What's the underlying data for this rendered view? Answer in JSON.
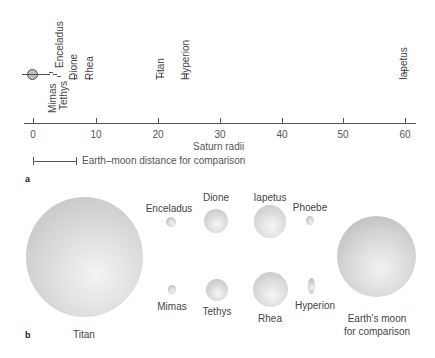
{
  "panel_a": {
    "label": "a",
    "axis_label": "Saturn radii",
    "ticks": [
      "0",
      "10",
      "20",
      "30",
      "40",
      "50",
      "60"
    ],
    "comparison_label": "Earth–moon distance for comparison",
    "moons": [
      {
        "name": "Mimas",
        "distance": 3.1
      },
      {
        "name": "Enceladus",
        "distance": 4.0
      },
      {
        "name": "Tethys",
        "distance": 4.9
      },
      {
        "name": "Dione",
        "distance": 6.3
      },
      {
        "name": "Rhea",
        "distance": 8.7
      },
      {
        "name": "Titan",
        "distance": 20.3
      },
      {
        "name": "Hyperion",
        "distance": 24.6
      },
      {
        "name": "Iapetus",
        "distance": 59.1
      }
    ]
  },
  "panel_b": {
    "label": "b",
    "moons": [
      {
        "name": "Titan"
      },
      {
        "name": "Enceladus"
      },
      {
        "name": "Dione"
      },
      {
        "name": "Iapetus"
      },
      {
        "name": "Phoebe"
      },
      {
        "name": "Mimas"
      },
      {
        "name": "Tethys"
      },
      {
        "name": "Rhea"
      },
      {
        "name": "Hyperion"
      },
      {
        "name": "Earth's moon\nfor comparison"
      }
    ],
    "earth_moon_line1": "Earth's moon",
    "earth_moon_line2": "for comparison"
  }
}
